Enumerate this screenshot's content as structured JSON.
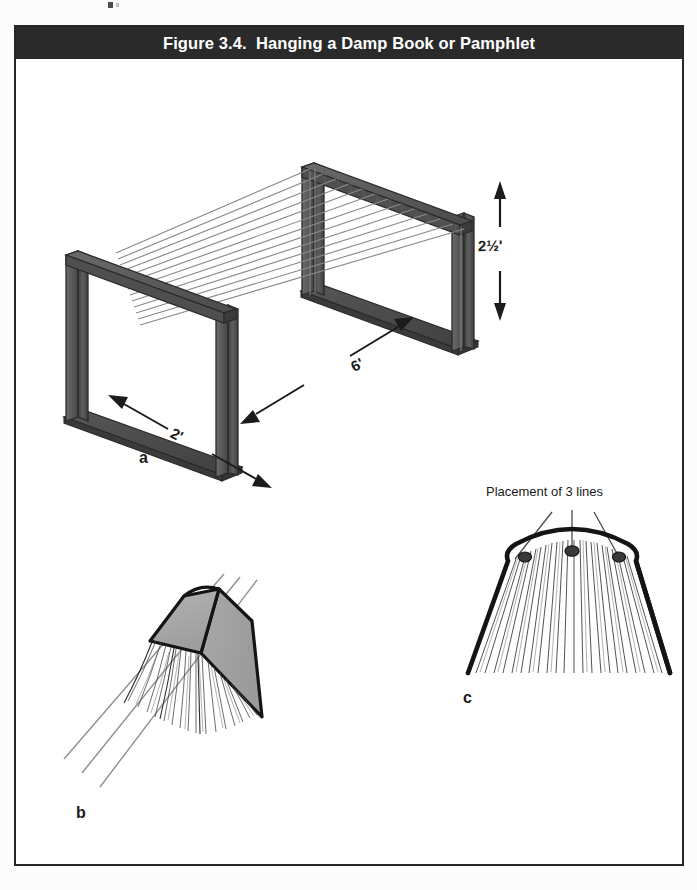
{
  "page": {
    "background_color": "#fcfcfc",
    "figure_border_color": "#262626"
  },
  "figure": {
    "header": {
      "background_color": "#2a2a2a",
      "text_color": "#ffffff",
      "title": "Figure 3.4.  Hanging a Damp Book or Pamphlet"
    },
    "subfigures": [
      {
        "id": "a",
        "label": "a",
        "name": "drying-rack-isometric",
        "description": "Isometric view of a wooden drying rack with two upright U-frames spanned by parallel drying lines",
        "line_count": 12,
        "dimensions": [
          {
            "name": "height",
            "label": "2½'",
            "value": "2 1/2",
            "unit": "feet",
            "arrow": "vertical-double"
          },
          {
            "name": "length",
            "label": "6'",
            "value": "6",
            "unit": "feet",
            "arrow": "diagonal-double"
          },
          {
            "name": "width",
            "label": "2'",
            "value": "2",
            "unit": "feet",
            "arrow": "diagonal-double"
          }
        ]
      },
      {
        "id": "b",
        "label": "b",
        "name": "book-draped-perspective",
        "description": "Perspective view of a damp book opened and draped tent-style across three drying lines with pages fanned downward",
        "line_count": 3,
        "cover_fill": "#a8a8a8"
      },
      {
        "id": "c",
        "label": "c",
        "name": "book-draped-end-view",
        "caption": "Placement of 3 lines",
        "description": "End-on view of the draped book showing the placement of three support lines along the spine area",
        "line_count": 3,
        "contact_points": 3
      }
    ]
  },
  "colors": {
    "wood_dark": "#454545",
    "wood_mid": "#5a5a5a",
    "wood_light": "#6e6e6e",
    "base_plate": "#4a4a4a",
    "ink": "#1b1b1b",
    "cover_gray": "#a8a8a8",
    "line_gray": "#8d8d8d"
  }
}
